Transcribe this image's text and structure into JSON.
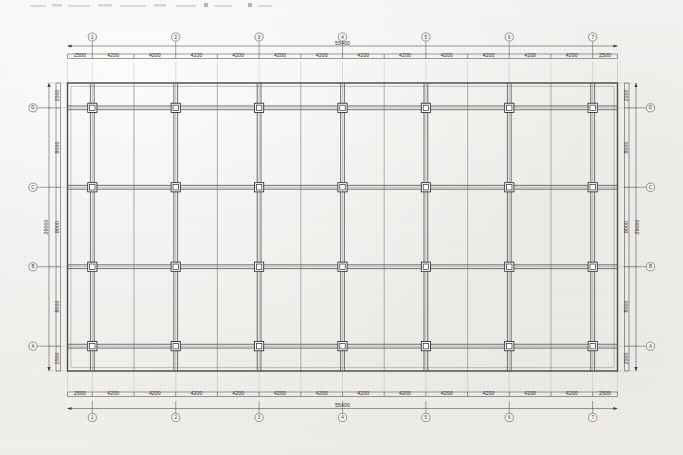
{
  "drawing": {
    "faint_header": "",
    "sheet_bg": "#f2f1ef",
    "ink_color": "#3a3a3a",
    "heavy_ink": "#2b2b2b",
    "light_ink": "#9a9a9a"
  },
  "plan": {
    "title": "",
    "overall_width_label": "55400",
    "overall_height_label": "29000",
    "horizontal_bays": [
      "2500",
      "4200",
      "4200",
      "4200",
      "4200",
      "4200",
      "4200",
      "4200",
      "4200",
      "4200",
      "4200",
      "4200",
      "4200",
      "2500"
    ],
    "vertical_bays_top_to_bottom": [
      "2500",
      "8000",
      "8000",
      "8000",
      "2500"
    ],
    "vertical_dim_labels_top_to_bottom": [
      "2500",
      "8000",
      "8000",
      "8000",
      "2500"
    ],
    "column_grid_labels_horizontal": [
      "1",
      "2",
      "3",
      "4",
      "5",
      "6",
      "7"
    ],
    "column_grid_labels_vertical_top_to_bottom": [
      "D",
      "C",
      "B",
      "A"
    ],
    "column_count": 28,
    "column_rows": 4,
    "column_cols": 7,
    "main_bay_spacing": "8400",
    "secondary_beam_spacing": "4200",
    "cantilever": "2500"
  },
  "chart_data": {
    "type": "table",
    "xlabel": "Grid lines 1-7 (horizontal)",
    "ylabel": "Grid lines A-D (vertical)",
    "categories": [
      "1",
      "2",
      "3",
      "4",
      "5",
      "6",
      "7"
    ],
    "series": [
      {
        "name": "D",
        "values": [
          1,
          1,
          1,
          1,
          1,
          1,
          1
        ]
      },
      {
        "name": "C",
        "values": [
          1,
          1,
          1,
          1,
          1,
          1,
          1
        ]
      },
      {
        "name": "B",
        "values": [
          1,
          1,
          1,
          1,
          1,
          1,
          1
        ]
      },
      {
        "name": "A",
        "values": [
          1,
          1,
          1,
          1,
          1,
          1,
          1
        ]
      }
    ],
    "x_dimensions_mm": [
      2500,
      4200,
      4200,
      4200,
      4200,
      4200,
      4200,
      4200,
      4200,
      4200,
      4200,
      4200,
      4200,
      2500
    ],
    "y_dimensions_mm": [
      2500,
      8000,
      8000,
      8000,
      2500
    ],
    "overall_x_mm": 55400,
    "overall_y_mm": 29000,
    "grid": true,
    "legend": "none"
  }
}
